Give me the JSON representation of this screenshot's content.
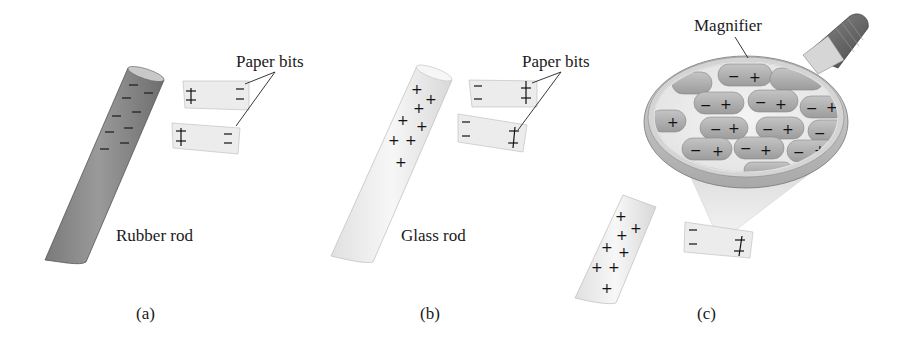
{
  "figure": {
    "panels": [
      {
        "id": "a",
        "caption": "(a)",
        "rod_label": "Rubber rod",
        "rod_charge": "negative",
        "rod_color": "#8c8c8c",
        "paper_label": "Paper bits",
        "paper_bits": [
          {
            "near_side": "+",
            "far_side": "−"
          },
          {
            "near_side": "+",
            "far_side": "−"
          }
        ]
      },
      {
        "id": "b",
        "caption": "(b)",
        "rod_label": "Glass rod",
        "rod_charge": "positive",
        "rod_color": "#ececec",
        "paper_label": "Paper bits",
        "paper_bits": [
          {
            "near_side": "−",
            "far_side": "+"
          },
          {
            "near_side": "−",
            "far_side": "+"
          }
        ]
      },
      {
        "id": "c",
        "caption": "(c)",
        "magnifier_label": "Magnifier",
        "rod_charge": "positive",
        "molecule_signs": [
          "−",
          "+"
        ],
        "paper_bit": {
          "near_side": "−",
          "far_side": "+"
        }
      }
    ]
  }
}
